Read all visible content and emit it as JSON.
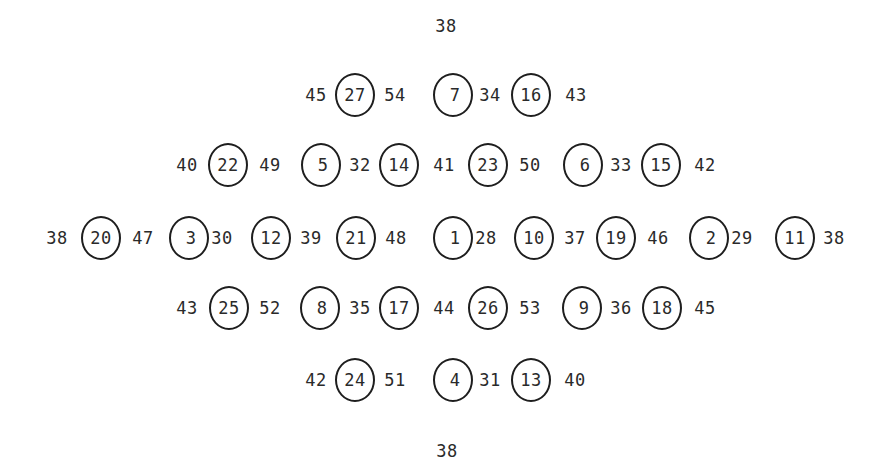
{
  "diagram": {
    "top_label": {
      "text": "38",
      "x": 446,
      "y": 26
    },
    "bottom_label": {
      "text": "38",
      "x": 447,
      "y": 451
    },
    "rows": [
      {
        "y": 95,
        "tokens": [
          {
            "type": "value",
            "text": "45",
            "x": 316
          },
          {
            "type": "node",
            "text": "27",
            "x": 355
          },
          {
            "type": "value",
            "text": "54",
            "x": 395
          },
          {
            "type": "node",
            "text": "7",
            "x": 453
          },
          {
            "type": "value",
            "text": "34",
            "x": 490
          },
          {
            "type": "node",
            "text": "16",
            "x": 531
          },
          {
            "type": "value",
            "text": "43",
            "x": 576
          }
        ]
      },
      {
        "y": 165,
        "tokens": [
          {
            "type": "value",
            "text": "40",
            "x": 187
          },
          {
            "type": "node",
            "text": "22",
            "x": 228
          },
          {
            "type": "value",
            "text": "49",
            "x": 270
          },
          {
            "type": "node",
            "text": "5",
            "x": 321
          },
          {
            "type": "value",
            "text": "32",
            "x": 360
          },
          {
            "type": "node",
            "text": "14",
            "x": 399
          },
          {
            "type": "value",
            "text": "41",
            "x": 444
          },
          {
            "type": "node",
            "text": "23",
            "x": 488
          },
          {
            "type": "value",
            "text": "50",
            "x": 530
          },
          {
            "type": "node",
            "text": "6",
            "x": 583
          },
          {
            "type": "value",
            "text": "33",
            "x": 621
          },
          {
            "type": "node",
            "text": "15",
            "x": 661
          },
          {
            "type": "value",
            "text": "42",
            "x": 705
          }
        ]
      },
      {
        "y": 238,
        "tokens": [
          {
            "type": "value",
            "text": "38",
            "x": 57
          },
          {
            "type": "node",
            "text": "20",
            "x": 101
          },
          {
            "type": "value",
            "text": "47",
            "x": 143
          },
          {
            "type": "node",
            "text": "3",
            "x": 189
          },
          {
            "type": "value",
            "text": "30",
            "x": 222
          },
          {
            "type": "node",
            "text": "12",
            "x": 271
          },
          {
            "type": "value",
            "text": "39",
            "x": 311
          },
          {
            "type": "node",
            "text": "21",
            "x": 356
          },
          {
            "type": "value",
            "text": "48",
            "x": 396
          },
          {
            "type": "node",
            "text": "1",
            "x": 453
          },
          {
            "type": "value",
            "text": "28",
            "x": 486
          },
          {
            "type": "node",
            "text": "10",
            "x": 534
          },
          {
            "type": "value",
            "text": "37",
            "x": 575
          },
          {
            "type": "node",
            "text": "19",
            "x": 616
          },
          {
            "type": "value",
            "text": "46",
            "x": 658
          },
          {
            "type": "node",
            "text": "2",
            "x": 709
          },
          {
            "type": "value",
            "text": "29",
            "x": 742
          },
          {
            "type": "node",
            "text": "11",
            "x": 795
          },
          {
            "type": "value",
            "text": "38",
            "x": 834
          }
        ]
      },
      {
        "y": 308,
        "tokens": [
          {
            "type": "value",
            "text": "43",
            "x": 187
          },
          {
            "type": "node",
            "text": "25",
            "x": 229
          },
          {
            "type": "value",
            "text": "52",
            "x": 270
          },
          {
            "type": "node",
            "text": "8",
            "x": 320
          },
          {
            "type": "value",
            "text": "35",
            "x": 360
          },
          {
            "type": "node",
            "text": "17",
            "x": 399
          },
          {
            "type": "value",
            "text": "44",
            "x": 444
          },
          {
            "type": "node",
            "text": "26",
            "x": 488
          },
          {
            "type": "value",
            "text": "53",
            "x": 530
          },
          {
            "type": "node",
            "text": "9",
            "x": 582
          },
          {
            "type": "value",
            "text": "36",
            "x": 621
          },
          {
            "type": "node",
            "text": "18",
            "x": 662
          },
          {
            "type": "value",
            "text": "45",
            "x": 705
          }
        ]
      },
      {
        "y": 380,
        "tokens": [
          {
            "type": "value",
            "text": "42",
            "x": 316
          },
          {
            "type": "node",
            "text": "24",
            "x": 355
          },
          {
            "type": "value",
            "text": "51",
            "x": 395
          },
          {
            "type": "node",
            "text": "4",
            "x": 453
          },
          {
            "type": "value",
            "text": "31",
            "x": 490
          },
          {
            "type": "node",
            "text": "13",
            "x": 531
          },
          {
            "type": "value",
            "text": "40",
            "x": 575
          }
        ]
      }
    ]
  }
}
